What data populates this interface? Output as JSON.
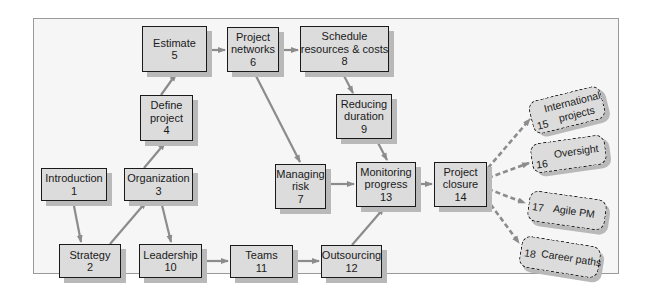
{
  "diagram": {
    "colors": {
      "box_fill": "#dcdcdc",
      "box_border": "#1a1a1a",
      "shadow": "#b9b9b9",
      "arrow": "#8c8c8c",
      "frame_bg": "#f6f6f6",
      "frame_border": "#9a9a9a"
    },
    "nodes": {
      "n1": {
        "label": "Introduction",
        "num": "1"
      },
      "n2": {
        "label": "Strategy",
        "num": "2"
      },
      "n3": {
        "label": "Organization",
        "num": "3"
      },
      "n4": {
        "label_line1": "Define",
        "label_line2": "project",
        "num": "4"
      },
      "n5": {
        "label": "Estimate",
        "num": "5"
      },
      "n6": {
        "label_line1": "Project",
        "label_line2": "networks",
        "num": "6"
      },
      "n7": {
        "label_line1": "Managing",
        "label_line2": "risk",
        "num": "7"
      },
      "n8": {
        "label_line1": "Schedule",
        "label_line2": "resources & costs",
        "num": "8"
      },
      "n9": {
        "label_line1": "Reducing",
        "label_line2": "duration",
        "num": "9"
      },
      "n10": {
        "label": "Leadership",
        "num": "10"
      },
      "n11": {
        "label": "Teams",
        "num": "11"
      },
      "n12": {
        "label": "Outsourcing",
        "num": "12"
      },
      "n13": {
        "label_line1": "Monitoring",
        "label_line2": "progress",
        "num": "13"
      },
      "n14": {
        "label_line1": "Project",
        "label_line2": "closure",
        "num": "14"
      },
      "n15": {
        "label_line1": "International",
        "label_line2": "projects",
        "num": "15"
      },
      "n16": {
        "label": "Oversight",
        "num": "16"
      },
      "n17": {
        "label": "Agile PM",
        "num": "17"
      },
      "n18": {
        "label": "Career paths",
        "num": "18"
      }
    },
    "edges": [
      {
        "from": "1",
        "to": "2",
        "style": "solid"
      },
      {
        "from": "2",
        "to": "3",
        "style": "solid"
      },
      {
        "from": "3",
        "to": "4",
        "style": "solid"
      },
      {
        "from": "4",
        "to": "5",
        "style": "solid"
      },
      {
        "from": "5",
        "to": "6",
        "style": "solid"
      },
      {
        "from": "6",
        "to": "8",
        "style": "solid"
      },
      {
        "from": "8",
        "to": "9",
        "style": "solid"
      },
      {
        "from": "6",
        "to": "7",
        "style": "solid"
      },
      {
        "from": "3",
        "to": "10",
        "style": "solid"
      },
      {
        "from": "10",
        "to": "11",
        "style": "solid"
      },
      {
        "from": "11",
        "to": "12",
        "style": "solid"
      },
      {
        "from": "12",
        "to": "13",
        "style": "solid"
      },
      {
        "from": "7",
        "to": "13",
        "style": "solid"
      },
      {
        "from": "9",
        "to": "13",
        "style": "solid"
      },
      {
        "from": "13",
        "to": "14",
        "style": "solid"
      },
      {
        "from": "14",
        "to": "15",
        "style": "dashed"
      },
      {
        "from": "14",
        "to": "16",
        "style": "dashed"
      },
      {
        "from": "14",
        "to": "17",
        "style": "dashed"
      },
      {
        "from": "14",
        "to": "18",
        "style": "dashed"
      }
    ]
  }
}
